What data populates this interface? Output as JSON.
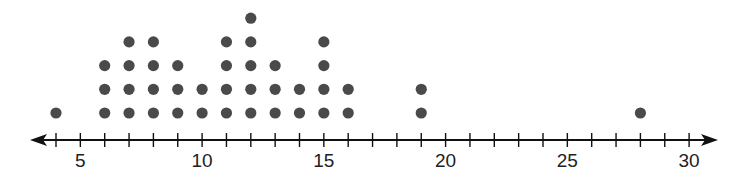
{
  "chart_data": {
    "type": "dot_plot",
    "title": "",
    "xlabel": "",
    "ylabel": "",
    "xlim": [
      3,
      31
    ],
    "tick_step": 1,
    "tick_labels": [
      "5",
      "10",
      "15",
      "20",
      "25",
      "30"
    ],
    "tick_label_values": [
      5,
      10,
      15,
      20,
      25,
      30
    ],
    "axis_arrows": "both",
    "grid": false,
    "points": [
      {
        "x": 4,
        "count": 1
      },
      {
        "x": 6,
        "count": 3
      },
      {
        "x": 7,
        "count": 4
      },
      {
        "x": 8,
        "count": 4
      },
      {
        "x": 9,
        "count": 3
      },
      {
        "x": 10,
        "count": 2
      },
      {
        "x": 11,
        "count": 4
      },
      {
        "x": 12,
        "count": 5
      },
      {
        "x": 13,
        "count": 3
      },
      {
        "x": 14,
        "count": 2
      },
      {
        "x": 15,
        "count": 4
      },
      {
        "x": 16,
        "count": 2
      },
      {
        "x": 19,
        "count": 2
      },
      {
        "x": 28,
        "count": 1
      }
    ],
    "total": 40,
    "colors": {
      "dot": "#4a4a4a",
      "axis": "#111111"
    }
  }
}
